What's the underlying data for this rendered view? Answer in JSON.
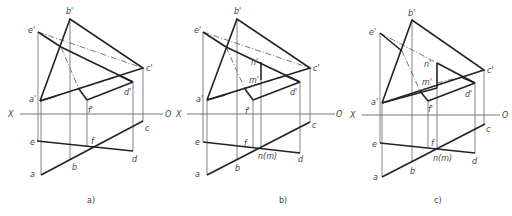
{
  "figure": {
    "panels": [
      {
        "id": "a",
        "caption": "a)",
        "caption_pos": [
          87,
          203
        ],
        "axis": {
          "x1": 20,
          "x2": 163,
          "y": 114,
          "x_label": "X",
          "x_label_pos": [
            8,
            117
          ],
          "o_label": "O",
          "o_label_pos": [
            165,
            117
          ]
        },
        "thick": [
          [
            [
              40,
              101
            ],
            [
              70,
              19
            ],
            [
              143,
              68
            ],
            [
              40,
              101
            ]
          ],
          [
            [
              38,
              32
            ],
            [
              61,
              47
            ]
          ],
          [
            [
              61,
              47
            ],
            [
              133,
              82
            ],
            [
              133,
              82
            ]
          ],
          [
            [
              40,
              101
            ],
            [
              56,
              96
            ]
          ],
          [
            [
              120,
              76
            ],
            [
              133,
              82
            ]
          ],
          [
            [
              133,
              82
            ],
            [
              87,
              100
            ]
          ],
          [
            [
              87,
              100
            ],
            [
              79,
              89
            ]
          ],
          [
            [
              41,
              175
            ],
            [
              143,
              121
            ]
          ],
          [
            [
              37,
              141
            ],
            [
              133,
              151
            ]
          ]
        ],
        "thin": [
          [
            [
              38,
              32
            ],
            [
              38,
              141
            ]
          ],
          [
            [
              41,
              101
            ],
            [
              41,
              175
            ]
          ],
          [
            [
              70,
              19
            ],
            [
              70,
              159
            ]
          ],
          [
            [
              143,
              68
            ],
            [
              143,
              121
            ]
          ],
          [
            [
              133,
              82
            ],
            [
              133,
              151
            ]
          ],
          [
            [
              87,
              100
            ],
            [
              87,
              147
            ]
          ]
        ],
        "dash": [
          [
            [
              61,
              47
            ],
            [
              79,
              89
            ]
          ],
          [
            [
              56,
              96
            ],
            [
              120,
              76
            ]
          ],
          [
            [
              38,
              32
            ],
            [
              143,
              68
            ]
          ]
        ],
        "labels": [
          {
            "t": "b'",
            "x": 66,
            "y": 14
          },
          {
            "t": "e'",
            "x": 28,
            "y": 33
          },
          {
            "t": "c'",
            "x": 146,
            "y": 71
          },
          {
            "t": "a'",
            "x": 29,
            "y": 102
          },
          {
            "t": "d'",
            "x": 124,
            "y": 95
          },
          {
            "t": "f'",
            "x": 88,
            "y": 113
          },
          {
            "t": "c",
            "x": 145,
            "y": 131
          },
          {
            "t": "e",
            "x": 30,
            "y": 145
          },
          {
            "t": "f",
            "x": 91,
            "y": 144
          },
          {
            "t": "d",
            "x": 132,
            "y": 162
          },
          {
            "t": "b",
            "x": 72,
            "y": 170
          },
          {
            "t": "a",
            "x": 30,
            "y": 177
          }
        ]
      },
      {
        "id": "b",
        "caption": "b)",
        "caption_pos": [
          279,
          203
        ],
        "axis": {
          "x1": 187,
          "x2": 335,
          "y": 114,
          "x_label": "X",
          "x_label_pos": [
            176,
            117
          ],
          "o_label": "O",
          "o_label_pos": [
            336,
            117
          ]
        },
        "thick": [
          [
            [
              207,
              100
            ],
            [
              237,
              19
            ],
            [
              310,
              68
            ],
            [
              207,
              100
            ]
          ],
          [
            [
              203,
              32
            ],
            [
              226,
              47
            ]
          ],
          [
            [
              226,
              47
            ],
            [
              300,
              82
            ]
          ],
          [
            [
              207,
              100
            ],
            [
              225,
              95
            ]
          ],
          [
            [
              286,
              76
            ],
            [
              300,
              82
            ]
          ],
          [
            [
              300,
              82
            ],
            [
              253,
              100
            ]
          ],
          [
            [
              253,
              100
            ],
            [
              245,
              89
            ]
          ],
          [
            [
              261,
              62
            ],
            [
              261,
              80
            ]
          ],
          [
            [
              207,
              175
            ],
            [
              310,
              122
            ]
          ],
          [
            [
              203,
              142
            ],
            [
              300,
              153
            ]
          ]
        ],
        "thin": [
          [
            [
              203,
              32
            ],
            [
              203,
              142
            ]
          ],
          [
            [
              207,
              100
            ],
            [
              207,
              175
            ]
          ],
          [
            [
              237,
              19
            ],
            [
              237,
              159
            ]
          ],
          [
            [
              310,
              68
            ],
            [
              310,
              122
            ]
          ],
          [
            [
              300,
              82
            ],
            [
              300,
              153
            ]
          ],
          [
            [
              253,
              100
            ],
            [
              253,
              147
            ]
          ],
          [
            [
              261,
              80
            ],
            [
              261,
              147
            ]
          ]
        ],
        "dash": [
          [
            [
              226,
              47
            ],
            [
              245,
              89
            ]
          ],
          [
            [
              225,
              95
            ],
            [
              286,
              76
            ]
          ],
          [
            [
              203,
              32
            ],
            [
              310,
              68
            ]
          ]
        ],
        "labels": [
          {
            "t": "b'",
            "x": 234,
            "y": 14
          },
          {
            "t": "e'",
            "x": 194,
            "y": 33
          },
          {
            "t": "c'",
            "x": 313,
            "y": 71
          },
          {
            "t": "n'",
            "x": 251,
            "y": 65
          },
          {
            "t": "m'",
            "x": 249,
            "y": 83
          },
          {
            "t": "a'",
            "x": 196,
            "y": 102
          },
          {
            "t": "d'",
            "x": 290,
            "y": 95
          },
          {
            "t": "f'",
            "x": 245,
            "y": 114
          },
          {
            "t": "c",
            "x": 312,
            "y": 128
          },
          {
            "t": "e",
            "x": 195,
            "y": 145
          },
          {
            "t": "f",
            "x": 244,
            "y": 146
          },
          {
            "t": "n(m)",
            "x": 258,
            "y": 159
          },
          {
            "t": "d",
            "x": 298,
            "y": 162
          },
          {
            "t": "b",
            "x": 235,
            "y": 171
          },
          {
            "t": "a",
            "x": 195,
            "y": 177
          }
        ]
      },
      {
        "id": "c",
        "caption": "c)",
        "caption_pos": [
          434,
          203
        ],
        "axis": {
          "x1": 362,
          "x2": 500,
          "y": 115,
          "x_label": "X",
          "x_label_pos": [
            350,
            118
          ],
          "o_label": "O",
          "o_label_pos": [
            502,
            118
          ]
        },
        "thick": [
          [
            [
              382,
              103
            ],
            [
              412,
              20
            ],
            [
              484,
              70
            ],
            [
              382,
              103
            ]
          ],
          [
            [
              380,
              33
            ],
            [
              402,
              51
            ]
          ],
          [
            [
              437,
              63
            ],
            [
              475,
              83
            ]
          ],
          [
            [
              437,
              63
            ],
            [
              437,
              88
            ]
          ],
          [
            [
              382,
              103
            ],
            [
              437,
              88
            ]
          ],
          [
            [
              461,
              77
            ],
            [
              475,
              83
            ]
          ],
          [
            [
              475,
              83
            ],
            [
              428,
              101
            ]
          ],
          [
            [
              428,
              101
            ],
            [
              420,
              91
            ]
          ],
          [
            [
              382,
              177
            ],
            [
              485,
              124
            ]
          ],
          [
            [
              380,
              143
            ],
            [
              475,
              153
            ]
          ]
        ],
        "thin": [
          [
            [
              380,
              33
            ],
            [
              380,
              143
            ]
          ],
          [
            [
              382,
              103
            ],
            [
              382,
              177
            ]
          ],
          [
            [
              412,
              20
            ],
            [
              412,
              162
            ]
          ],
          [
            [
              484,
              70
            ],
            [
              484,
              124
            ]
          ],
          [
            [
              475,
              83
            ],
            [
              475,
              153
            ]
          ],
          [
            [
              428,
              101
            ],
            [
              428,
              148
            ]
          ],
          [
            [
              437,
              88
            ],
            [
              437,
              148
            ]
          ]
        ],
        "dash": [
          [
            [
              402,
              51
            ],
            [
              420,
              91
            ]
          ],
          [
            [
              437,
              83
            ],
            [
              461,
              77
            ]
          ],
          [
            [
              380,
              33
            ],
            [
              437,
              63
            ]
          ]
        ],
        "labels": [
          {
            "t": "b'",
            "x": 408,
            "y": 16
          },
          {
            "t": "e'",
            "x": 369,
            "y": 35
          },
          {
            "t": "c'",
            "x": 487,
            "y": 73
          },
          {
            "t": "n'",
            "x": 424,
            "y": 67
          },
          {
            "t": "m'",
            "x": 422,
            "y": 85
          },
          {
            "t": "a'",
            "x": 371,
            "y": 105
          },
          {
            "t": "d'",
            "x": 465,
            "y": 97
          },
          {
            "t": "f'",
            "x": 428,
            "y": 112
          },
          {
            "t": "c",
            "x": 486,
            "y": 132
          },
          {
            "t": "e",
            "x": 372,
            "y": 147
          },
          {
            "t": "f",
            "x": 431,
            "y": 146
          },
          {
            "t": "n(m)",
            "x": 433,
            "y": 161
          },
          {
            "t": "d",
            "x": 472,
            "y": 164
          },
          {
            "t": "b",
            "x": 410,
            "y": 174
          },
          {
            "t": "a",
            "x": 373,
            "y": 180
          }
        ]
      }
    ]
  }
}
